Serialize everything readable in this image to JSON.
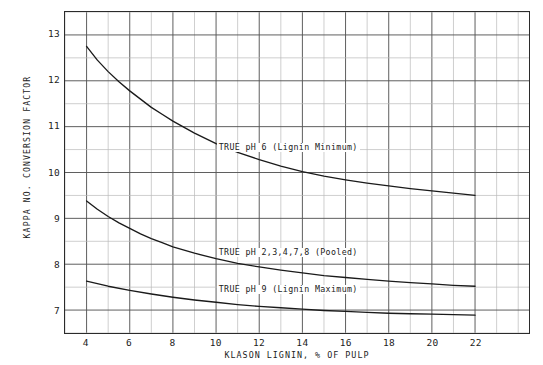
{
  "chart_data": {
    "type": "line",
    "title": "",
    "xlabel": "KLASON LIGNIN, % OF PULP",
    "ylabel": "KAPPA NO. CONVERSION FACTOR",
    "xlim": [
      3,
      24.5
    ],
    "ylim": [
      6.5,
      13.5
    ],
    "xticks": [
      4,
      6,
      8,
      10,
      12,
      14,
      16,
      18,
      20,
      22
    ],
    "xtick_labels": [
      "4",
      "6",
      "8",
      "10",
      "12",
      "14",
      "16",
      "18",
      "20",
      "22"
    ],
    "yticks": [
      7,
      8,
      9,
      10,
      11,
      12,
      13
    ],
    "ytick_labels": [
      "7",
      "8",
      "9",
      "10",
      "11",
      "12",
      "13"
    ],
    "x_minor_step": 1,
    "y_minor_step": 0.5,
    "grid": true,
    "grid_major_color": "#555555",
    "grid_minor_color": "#b8b8b8",
    "legend": "none",
    "curve_color": "#1a1a1a",
    "series": [
      {
        "name": "TRUE pH 6 (Lignin Minimum)",
        "label": "TRUE pH 6 (Lignin Minimum)",
        "label_x": 10.0,
        "label_y": 10.55,
        "x": [
          4,
          4.5,
          5,
          5.5,
          6,
          6.5,
          7,
          7.5,
          8,
          9,
          10,
          11,
          12,
          13,
          14,
          15,
          16,
          17,
          18,
          19,
          20,
          21,
          22
        ],
        "y": [
          12.75,
          12.45,
          12.2,
          11.98,
          11.78,
          11.6,
          11.42,
          11.27,
          11.12,
          10.86,
          10.63,
          10.44,
          10.28,
          10.14,
          10.02,
          9.92,
          9.84,
          9.77,
          9.71,
          9.65,
          9.6,
          9.55,
          9.5
        ]
      },
      {
        "name": "TRUE pH 2,3,4,7,8 (Pooled)",
        "label": "TRUE pH 2,3,4,7,8 (Pooled)",
        "label_x": 10.0,
        "label_y": 8.28,
        "x": [
          4,
          4.5,
          5,
          5.5,
          6,
          6.5,
          7,
          7.5,
          8,
          9,
          10,
          11,
          12,
          13,
          14,
          15,
          16,
          17,
          18,
          19,
          20,
          21,
          22
        ],
        "y": [
          9.38,
          9.2,
          9.04,
          8.9,
          8.78,
          8.66,
          8.56,
          8.47,
          8.38,
          8.24,
          8.12,
          8.02,
          7.94,
          7.87,
          7.81,
          7.75,
          7.71,
          7.67,
          7.63,
          7.6,
          7.57,
          7.54,
          7.52
        ]
      },
      {
        "name": "TRUE pH 9 (Lignin Maximum)",
        "label": "TRUE pH 9 (Lignin Maximum)",
        "label_x": 10.0,
        "label_y": 7.47,
        "x": [
          4,
          5,
          6,
          7,
          8,
          9,
          10,
          11,
          12,
          13,
          14,
          15,
          16,
          17,
          18,
          19,
          20,
          21,
          22
        ],
        "y": [
          7.63,
          7.52,
          7.43,
          7.35,
          7.28,
          7.22,
          7.17,
          7.12,
          7.08,
          7.05,
          7.02,
          6.99,
          6.97,
          6.95,
          6.93,
          6.92,
          6.91,
          6.9,
          6.89
        ]
      }
    ]
  },
  "footer": {
    "note": ""
  }
}
